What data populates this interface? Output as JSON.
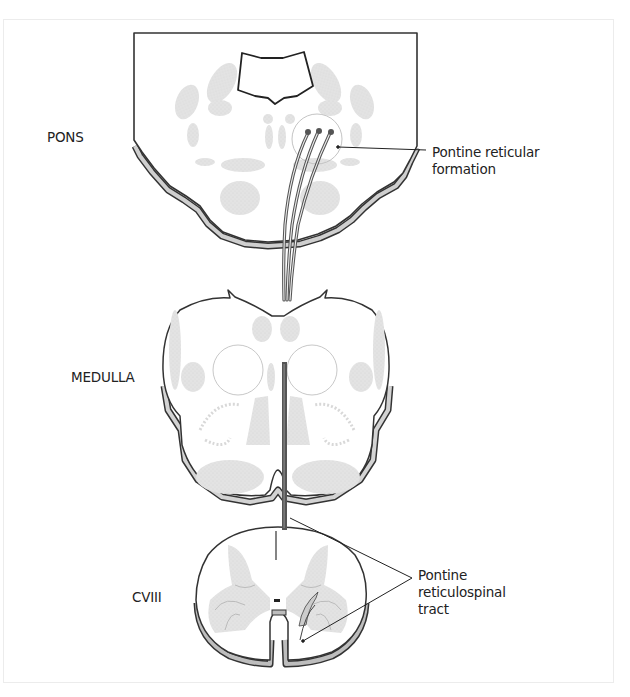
{
  "figure": {
    "regions": {
      "pons": "PONS",
      "medulla": "MEDULLA",
      "spinal_level": "CVIII"
    },
    "annotations": {
      "pontine_reticular_formation": [
        "Pontine reticular",
        "formation"
      ],
      "pontine_reticulospinal_tract": [
        "Pontine",
        "reticulospinal",
        "tract"
      ]
    },
    "colors": {
      "outline": "#333333",
      "tract": "#555555",
      "tissue_fill": "#e6e6e6",
      "nuclei_fill": "#e4e4e4",
      "rim_fill": "#cfcfcf",
      "background": "#ffffff"
    }
  }
}
